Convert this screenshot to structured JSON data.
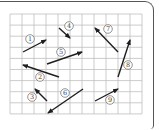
{
  "diagram": {
    "type": "vector-grid",
    "grid": {
      "x0": 10,
      "y0": 14,
      "cols": 11,
      "rows": 9,
      "cell_w": 12,
      "cell_h": 11.1,
      "line_color": "#bfbfbf"
    },
    "arrow_color": "#1e1e1e",
    "vectors": [
      {
        "id": 1,
        "label": "①",
        "tail": [
          23,
          52
        ],
        "head": [
          46,
          40
        ],
        "label_pos": [
          30,
          39
        ]
      },
      {
        "id": 2,
        "label": "②",
        "tail": [
          59,
          77
        ],
        "head": [
          23,
          65
        ],
        "label_pos": [
          40,
          77
        ]
      },
      {
        "id": 3,
        "label": "③",
        "tail": [
          47,
          101
        ],
        "head": [
          35,
          89
        ],
        "label_pos": [
          32,
          97
        ]
      },
      {
        "id": 4,
        "label": "④",
        "tail": [
          59,
          28
        ],
        "head": [
          70,
          38
        ],
        "label_pos": [
          69,
          26
        ]
      },
      {
        "id": 5,
        "label": "⑤",
        "tail": [
          47,
          64
        ],
        "head": [
          82,
          52
        ],
        "label_pos": [
          61,
          52
        ]
      },
      {
        "id": 6,
        "label": "⑥",
        "tail": [
          83,
          89
        ],
        "head": [
          48,
          113
        ],
        "label_pos": [
          65,
          93
        ]
      },
      {
        "id": 7,
        "label": "⑦",
        "tail": [
          118,
          52
        ],
        "head": [
          95,
          28
        ],
        "label_pos": [
          108,
          29
        ]
      },
      {
        "id": 8,
        "label": "⑧",
        "tail": [
          118,
          77
        ],
        "head": [
          130,
          40
        ],
        "label_pos": [
          128,
          65
        ]
      },
      {
        "id": 9,
        "label": "⑨",
        "tail": [
          95,
          101
        ],
        "head": [
          118,
          89
        ],
        "label_pos": [
          110,
          100
        ]
      }
    ]
  }
}
